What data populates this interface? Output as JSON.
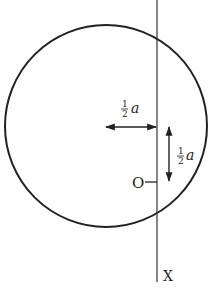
{
  "diagram": {
    "type": "geometry-figure",
    "circle": {
      "cx": 106,
      "cy": 126,
      "r": 101
    },
    "axis": {
      "label": "X",
      "x": 157,
      "y_top": 0,
      "y_bottom": 282
    },
    "point": {
      "label": "O",
      "y": 182
    },
    "horizontal_dimension": {
      "numerator": "1",
      "denominator": "2",
      "variable": "a",
      "text": "½a"
    },
    "vertical_dimension": {
      "numerator": "1",
      "denominator": "2",
      "variable": "a",
      "text": "½a"
    },
    "colors": {
      "stroke": "#222222",
      "background": "#ffffff"
    }
  }
}
